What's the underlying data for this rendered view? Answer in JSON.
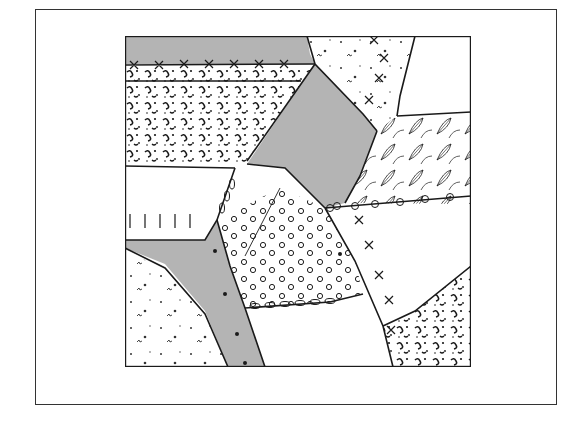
{
  "figure": {
    "colors": {
      "gray_patch": "#b4b4b4",
      "ink": "#1a1a1a",
      "background": "#ffffff"
    },
    "patches": [
      {
        "name": "top-left-gray",
        "fill": "gray"
      },
      {
        "name": "left-speckled",
        "fill": "speckled"
      },
      {
        "name": "top-center-speckled",
        "fill": "light-speckled"
      },
      {
        "name": "center-gray-diamond",
        "fill": "gray"
      },
      {
        "name": "right-leaf-print",
        "fill": "leaf-print"
      },
      {
        "name": "middle-left-plain",
        "fill": "plain"
      },
      {
        "name": "polka-dot",
        "fill": "dots"
      },
      {
        "name": "right-plain",
        "fill": "plain"
      },
      {
        "name": "lower-left-gray-band",
        "fill": "gray"
      },
      {
        "name": "bottom-left-speckled",
        "fill": "light-speckled"
      },
      {
        "name": "bottom-center-plain",
        "fill": "plain"
      },
      {
        "name": "bottom-right-speckled",
        "fill": "speckled"
      }
    ]
  }
}
